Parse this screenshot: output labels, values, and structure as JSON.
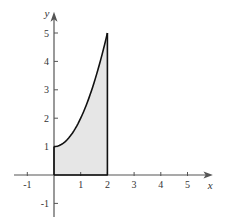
{
  "chart_data": {
    "type": "area",
    "title": "",
    "xlabel": "x",
    "ylabel": "y",
    "xlim": [
      -1,
      5.8
    ],
    "ylim": [
      -1.5,
      5.6
    ],
    "xticks": [
      -1,
      1,
      2,
      3,
      4,
      5
    ],
    "yticks": [
      -1,
      1,
      2,
      3,
      4,
      5
    ],
    "grid": false,
    "series": [
      {
        "name": "y = 1 + x^2",
        "x": [
          0,
          0.25,
          0.5,
          0.75,
          1,
          1.25,
          1.5,
          1.75,
          2
        ],
        "y": [
          1,
          1.0625,
          1.25,
          1.5625,
          2,
          2.5625,
          3.25,
          4.0625,
          5
        ],
        "fill_under": true,
        "fill_color": "#e6e6e6",
        "line_color": "#111111"
      }
    ],
    "shaded_region": {
      "x_from": 0,
      "x_to": 2,
      "bounded_by": "curve and x-axis"
    }
  },
  "labels": {
    "x_axis": "x",
    "y_axis": "y",
    "x_ticks": [
      "-1",
      "1",
      "2",
      "3",
      "4",
      "5"
    ],
    "y_ticks": [
      "-1",
      "1",
      "2",
      "3",
      "4",
      "5"
    ]
  }
}
